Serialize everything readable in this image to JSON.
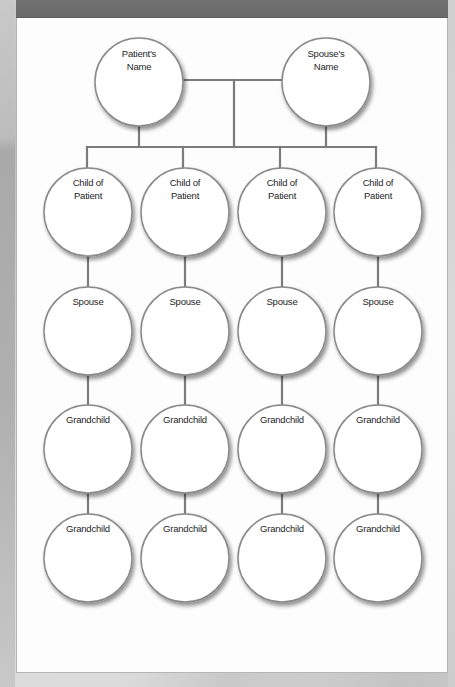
{
  "diagram": {
    "type": "family-tree",
    "colors": {
      "header_bar": "#6f6f6f",
      "connector": "#7c7c7c",
      "circle_stroke": "#8a8a8a",
      "circle_fill": "#ffffff",
      "page": "#fdfdfd"
    },
    "parents": [
      {
        "id": "patient",
        "label_lines": [
          "Patient's",
          "Name"
        ]
      },
      {
        "id": "spouse",
        "label_lines": [
          "Spouse's",
          "Name"
        ]
      }
    ],
    "columns": [
      {
        "id": "child-1",
        "nodes": [
          {
            "role": "child",
            "label_lines": [
              "Child of",
              "Patient"
            ]
          },
          {
            "role": "spouse",
            "label_lines": [
              "Spouse"
            ]
          },
          {
            "role": "grandchild",
            "label_lines": [
              "Grandchild"
            ]
          },
          {
            "role": "grandchild",
            "label_lines": [
              "Grandchild"
            ]
          }
        ]
      },
      {
        "id": "child-2",
        "nodes": [
          {
            "role": "child",
            "label_lines": [
              "Child of",
              "Patient"
            ]
          },
          {
            "role": "spouse",
            "label_lines": [
              "Spouse"
            ]
          },
          {
            "role": "grandchild",
            "label_lines": [
              "Grandchild"
            ]
          },
          {
            "role": "grandchild",
            "label_lines": [
              "Grandchild"
            ]
          }
        ]
      },
      {
        "id": "child-3",
        "nodes": [
          {
            "role": "child",
            "label_lines": [
              "Child of",
              "Patient"
            ]
          },
          {
            "role": "spouse",
            "label_lines": [
              "Spouse"
            ]
          },
          {
            "role": "grandchild",
            "label_lines": [
              "Grandchild"
            ]
          },
          {
            "role": "grandchild",
            "label_lines": [
              "Grandchild"
            ]
          }
        ]
      },
      {
        "id": "child-4",
        "nodes": [
          {
            "role": "child",
            "label_lines": [
              "Child of",
              "Patient"
            ]
          },
          {
            "role": "spouse",
            "label_lines": [
              "Spouse"
            ]
          },
          {
            "role": "grandchild",
            "label_lines": [
              "Grandchild"
            ]
          },
          {
            "role": "grandchild",
            "label_lines": [
              "Grandchild"
            ]
          }
        ]
      }
    ]
  }
}
